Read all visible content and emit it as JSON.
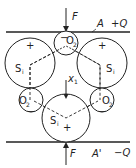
{
  "diagram": {
    "title": "",
    "force_top_label": "F",
    "force_bottom_label": "F",
    "plate_top_label": "A",
    "plate_top_charge": "+Q",
    "plate_bottom_label": "A'",
    "plate_bottom_charge": "−Q",
    "displacement_label": "x",
    "displacement_sub": "1",
    "atoms": [
      {
        "id": "o2-top",
        "label": "O",
        "sub": "2",
        "charge": "−"
      },
      {
        "id": "si-left",
        "label": "S",
        "sub": "i",
        "charge": "+"
      },
      {
        "id": "si-right",
        "label": "S",
        "sub": "i",
        "charge": "+"
      },
      {
        "id": "o2-left",
        "label": "O",
        "sub": "2",
        "charge": "−"
      },
      {
        "id": "o2-right",
        "label": "O",
        "sub": "2",
        "charge": "−"
      },
      {
        "id": "si-bottom",
        "label": "S",
        "sub": "i",
        "charge": "+"
      }
    ],
    "colors": {
      "line": "#222222",
      "background": "#ffffff"
    }
  }
}
